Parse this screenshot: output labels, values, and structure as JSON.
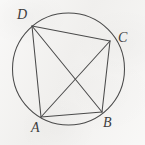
{
  "figure": {
    "kind": "geometry-diagram",
    "background_color": "#f3f2f0",
    "stroke_color": "#4a4a4a",
    "label_color": "#3d3d3d",
    "circle": {
      "center_x": 68.5,
      "center_y": 69,
      "radius": 56
    },
    "points": [
      {
        "id": "A",
        "label": "A",
        "x": 41,
        "y": 117,
        "label_x": 31,
        "label_y": 121
      },
      {
        "id": "B",
        "label": "B",
        "x": 102,
        "y": 112,
        "label_x": 103,
        "label_y": 116
      },
      {
        "id": "C",
        "label": "C",
        "x": 110,
        "y": 41,
        "label_x": 118,
        "label_y": 31
      },
      {
        "id": "D",
        "label": "D",
        "x": 32,
        "y": 26,
        "label_x": 17,
        "label_y": 8
      }
    ],
    "segments": [
      {
        "id": "AB",
        "from": "A",
        "to": "B",
        "role": "quadrilateral-side"
      },
      {
        "id": "BC",
        "from": "B",
        "to": "C",
        "role": "quadrilateral-side"
      },
      {
        "id": "CD",
        "from": "C",
        "to": "D",
        "role": "quadrilateral-side"
      },
      {
        "id": "DA",
        "from": "D",
        "to": "A",
        "role": "quadrilateral-side"
      },
      {
        "id": "AC",
        "from": "A",
        "to": "C",
        "role": "diagonal"
      },
      {
        "id": "BD",
        "from": "B",
        "to": "D",
        "role": "diagonal"
      }
    ]
  }
}
